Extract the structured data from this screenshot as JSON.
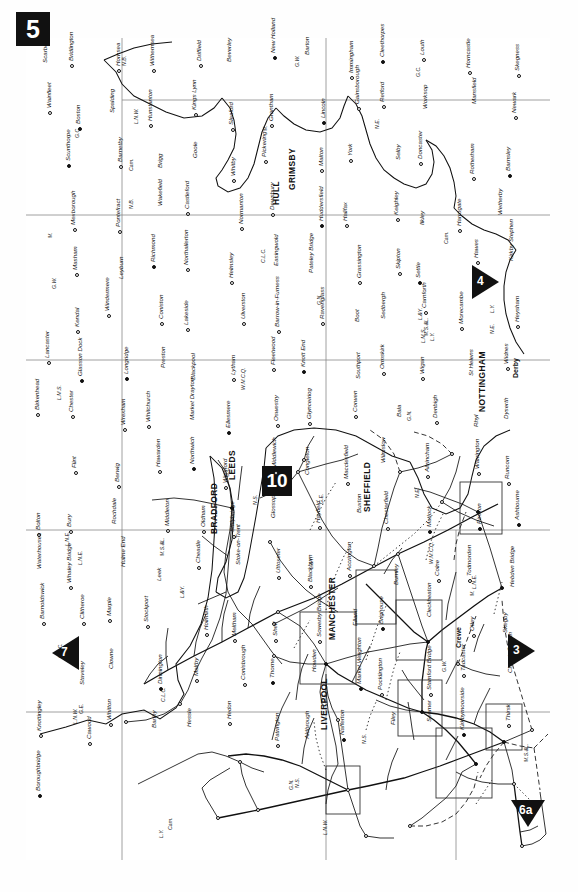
{
  "page": {
    "number": "5",
    "orientation": "landscape-rotated-90ccw"
  },
  "page_links": [
    {
      "id": "link-7",
      "label": "7",
      "direction": "north",
      "screen_x": 60,
      "screen_y": 650
    },
    {
      "id": "link-4",
      "label": "4",
      "direction": "south",
      "screen_x": 455,
      "screen_y": 280
    },
    {
      "id": "link-3",
      "label": "3",
      "direction": "south",
      "screen_x": 490,
      "screen_y": 648
    },
    {
      "id": "link-6a",
      "label": "6a",
      "direction": "west",
      "screen_x": 512,
      "screen_y": 812
    },
    {
      "id": "link-10",
      "label": "10",
      "direction": "inset",
      "screen_x": 277,
      "screen_y": 480
    }
  ],
  "cities": [
    {
      "name": "HULL",
      "x": 0.415,
      "y": 0.092
    },
    {
      "name": "GRIMSBY",
      "x": 0.296,
      "y": 0.168
    },
    {
      "name": "LEEDS",
      "x": 0.456,
      "y": 0.402
    },
    {
      "name": "BRADFORD",
      "x": 0.414,
      "y": 0.448
    },
    {
      "name": "SHEFFIELD",
      "x": 0.312,
      "y": 0.505
    },
    {
      "name": "MANCHESTER",
      "x": 0.347,
      "y": 0.615
    },
    {
      "name": "LIVERPOOL",
      "x": 0.31,
      "y": 0.706
    },
    {
      "name": "NOTTINGHAM",
      "x": 0.19,
      "y": 0.84
    },
    {
      "name": "Derby",
      "x": 0.19,
      "y": 0.76
    },
    {
      "name": "Crewe",
      "x": 0.19,
      "y": 0.64
    }
  ],
  "places": [
    "Scarborough",
    "Bridlington",
    "Hornsea",
    "Withernsea",
    "Driffield",
    "Beverley",
    "New Holland",
    "Barton",
    "Immingham",
    "Cleethorpes",
    "Louth",
    "Horncastle",
    "Skegness",
    "Wainfleet",
    "Boston",
    "Spalding",
    "Hunstanton",
    "Kings Lynn",
    "Sleaford",
    "Grantham",
    "Lincoln",
    "Gainsborough",
    "Retford",
    "Worksop",
    "Mansfield",
    "Newark",
    "Melton",
    "Scunthorpe",
    "Barnetby",
    "Brigg",
    "Goole",
    "Whitby",
    "Pickering",
    "Malton",
    "York",
    "Selby",
    "Doncaster",
    "Rotherham",
    "Barnsley",
    "Wath",
    "Mexborough",
    "Pontefract",
    "Wakefield",
    "Castleford",
    "Normanton",
    "Dewsbury",
    "Huddersfield",
    "Halifax",
    "Keighley",
    "Ilkley",
    "Harrogate",
    "Wetherby",
    "Ripon",
    "Masham",
    "Leyburn",
    "Richmond",
    "Northallerton",
    "Helmsley",
    "Easingwold",
    "Pateley Bridge",
    "Grassington",
    "Skipton",
    "Settle",
    "Hawes",
    "Kirkby Stephen",
    "Tebay",
    "Kendal",
    "Windermere",
    "Coniston",
    "Lakeside",
    "Ulverston",
    "Barrow-in-Furness",
    "Ravenglass",
    "Boot",
    "Sedbergh",
    "Carnforth",
    "Morecambe",
    "Heysham",
    "Lancaster",
    "Glasson Dock",
    "Longridge",
    "Preston",
    "Blackpool",
    "Lytham",
    "Fleetwood",
    "Knott End",
    "Southport",
    "Ormskirk",
    "Wigan",
    "St Helens",
    "Widnes",
    "Birkenhead",
    "Chester",
    "Wrexham",
    "Whitchurch",
    "Market Drayton",
    "Ellesmere",
    "Oswestry",
    "Glynceiriog",
    "Corwen",
    "Bala",
    "Denbigh",
    "Rhyl",
    "Dyserth",
    "Holywell",
    "Flint",
    "Berwig",
    "Hawarden",
    "Northwich",
    "Winsford",
    "Middlewich",
    "Congleton",
    "Macclesfield",
    "Wilmslow",
    "Altrincham",
    "Warrington",
    "Runcorn",
    "Bolton",
    "Bury",
    "Rochdale",
    "Middleton",
    "Oldham",
    "Stalybridge",
    "Glossop",
    "Hayfield",
    "Buxton",
    "Chesterfield",
    "Matlock",
    "Pinxton",
    "Ashbourne",
    "Waterhouses",
    "Whaley Bridge",
    "Hulme End",
    "Leek",
    "Cheadle",
    "Stoke-on-Trent",
    "Uttoxeter",
    "Blackburn",
    "Accrington",
    "Burnley",
    "Colne",
    "Todmorden",
    "Hebden Bridge",
    "Barnoldswick",
    "Clitheroe",
    "Marple",
    "Stockport",
    "Holmfirth",
    "Meltham",
    "Shelf",
    "Sowerby Bridge",
    "Elland",
    "Brighouse",
    "Cleckheaton",
    "Otley",
    "Skegby",
    "Shirebrook",
    "Staveley",
    "Clowne",
    "Dinnington",
    "Maltby",
    "Conisbrough",
    "Thorne",
    "Howden",
    "Market Weighton",
    "Pocklington",
    "Stamford Bridge",
    "Tadcaster",
    "Church Fenton",
    "Knottingley",
    "Cawood",
    "Whitton",
    "Barlby",
    "Hessle",
    "Hedon",
    "Patrington",
    "Aldbrough",
    "Nafferton",
    "Filey",
    "Seamer",
    "Kirkbymoorside",
    "Thirsk",
    "Boroughbridge"
  ],
  "railway_companies": [
    "N.E.",
    "L.N.W.",
    "L.Y.",
    "G.C.",
    "G.N.",
    "M.",
    "L.N.E.",
    "G.E.",
    "M.S.&L.",
    "C.L.C.",
    "L.&Y.",
    "N.S.",
    "Cam.",
    "G.W.",
    "L.M.S.",
    "W.M.C.Q.",
    "N.B."
  ],
  "legend": {
    "description": "Railway network map showing lines, stations and junctions",
    "line_styles": [
      "solid",
      "dashed",
      "dotted"
    ]
  },
  "insets": [
    {
      "name": "leeds-bradford-inset"
    },
    {
      "name": "sheffield-inset"
    },
    {
      "name": "manchester-inset"
    },
    {
      "name": "liverpool-inset"
    },
    {
      "name": "nottingham-inset"
    },
    {
      "name": "preston-inset"
    },
    {
      "name": "doncaster-inset"
    }
  ],
  "colors": {
    "ink": "#111111",
    "paper": "#fefefe",
    "grid": "#777777",
    "badge_bg": "#111111",
    "badge_fg": "#ffffff"
  }
}
